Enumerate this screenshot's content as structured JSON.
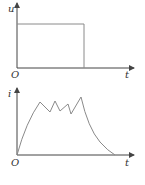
{
  "top_graph": {
    "y_label": "u",
    "x_label": "t",
    "origin_label": "O",
    "description": "Rectangular voltage pulse"
  },
  "bottom_graph": {
    "y_label": "i",
    "x_label": "t",
    "origin_label": "O",
    "description": "Current rises, oscillates with sawtooth peaks, then decays to zero"
  },
  "colors": {
    "axis": "#444444",
    "curve": "#8a8a8a"
  }
}
